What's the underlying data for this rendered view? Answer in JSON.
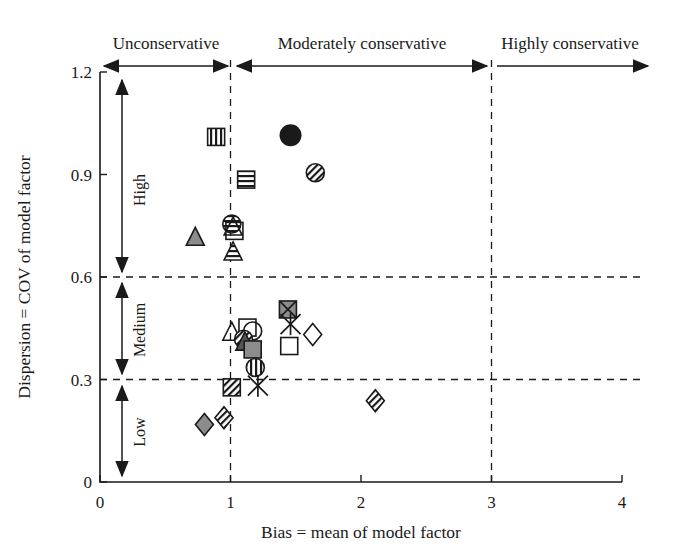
{
  "figure": {
    "top_clipped_caption": "",
    "background": "#ffffff",
    "ink_color": "#1a1a1a",
    "gray_fill": "#8c8c8c"
  },
  "axes": {
    "x_title": "Bias = mean of model factor",
    "y_title": "Dispersion = COV of model factor",
    "x_ticks": [
      "0",
      "1",
      "2",
      "3",
      "4"
    ],
    "y_ticks": [
      "0",
      "0.3",
      "0.6",
      "0.9",
      "1.2"
    ],
    "xlim": [
      0,
      4
    ],
    "ylim": [
      0,
      1.2
    ]
  },
  "zones": {
    "top_labels": [
      "Unconservative",
      "Moderately conservative",
      "Highly conservative"
    ],
    "side_labels": [
      "High",
      "Medium",
      "Low"
    ],
    "vertical_dividers": [
      1,
      3
    ],
    "horizontal_dividers": [
      0.3,
      0.6
    ]
  },
  "chart_data": {
    "type": "scatter",
    "title": "",
    "xlabel": "Bias = mean of model factor",
    "ylabel": "Dispersion = COV of model factor",
    "xlim": [
      0,
      4
    ],
    "ylim": [
      0,
      1.2
    ],
    "xticks": [
      0,
      1,
      2,
      3,
      4
    ],
    "yticks": [
      0,
      0.3,
      0.6,
      0.9,
      1.2
    ],
    "grid": false,
    "legend": "none",
    "reference_lines": {
      "vertical_dashed_x": [
        1,
        3
      ],
      "horizontal_dashed_y": [
        0.3,
        0.6
      ]
    },
    "annotations": [
      {
        "text": "Unconservative",
        "region_x": [
          0,
          1
        ]
      },
      {
        "text": "Moderately conservative",
        "region_x": [
          1,
          3
        ]
      },
      {
        "text": "Highly conservative",
        "region_x": [
          3,
          4
        ]
      },
      {
        "text": "High",
        "region_y": [
          0.6,
          1.2
        ]
      },
      {
        "text": "Medium",
        "region_y": [
          0.3,
          0.6
        ]
      },
      {
        "text": "Low",
        "region_y": [
          0,
          0.3
        ]
      }
    ],
    "points": [
      {
        "x": 0.89,
        "y": 1.01,
        "marker": "square-vertical-stripes"
      },
      {
        "x": 1.12,
        "y": 0.885,
        "marker": "square-horizontal-stripes"
      },
      {
        "x": 1.46,
        "y": 1.015,
        "marker": "circle-filled"
      },
      {
        "x": 1.65,
        "y": 0.905,
        "marker": "circle-diagonal-hatch"
      },
      {
        "x": 1.01,
        "y": 0.755,
        "marker": "circle-horizontal-stripes"
      },
      {
        "x": 1.02,
        "y": 0.745,
        "marker": "triangle-open"
      },
      {
        "x": 1.03,
        "y": 0.735,
        "marker": "square-open"
      },
      {
        "x": 0.73,
        "y": 0.715,
        "marker": "triangle-gray-filled"
      },
      {
        "x": 1.02,
        "y": 0.672,
        "marker": "triangle-horizontal-stripes"
      },
      {
        "x": 1.44,
        "y": 0.505,
        "marker": "square-gray-x"
      },
      {
        "x": 1.46,
        "y": 0.462,
        "marker": "x-cross"
      },
      {
        "x": 1.13,
        "y": 0.452,
        "marker": "square-open"
      },
      {
        "x": 1.17,
        "y": 0.442,
        "marker": "circle-open"
      },
      {
        "x": 1.63,
        "y": 0.432,
        "marker": "diamond-open"
      },
      {
        "x": 1.01,
        "y": 0.437,
        "marker": "triangle-open"
      },
      {
        "x": 1.1,
        "y": 0.418,
        "marker": "circle-diagonal-hatch"
      },
      {
        "x": 1.11,
        "y": 0.408,
        "marker": "triangle-filled-dark"
      },
      {
        "x": 1.45,
        "y": 0.398,
        "marker": "square-open"
      },
      {
        "x": 1.17,
        "y": 0.388,
        "marker": "square-gray-filled"
      },
      {
        "x": 1.19,
        "y": 0.335,
        "marker": "circle-vertical-stripes"
      },
      {
        "x": 1.01,
        "y": 0.277,
        "marker": "square-diagonal-hatch"
      },
      {
        "x": 1.21,
        "y": 0.282,
        "marker": "x-cross"
      },
      {
        "x": 2.11,
        "y": 0.238,
        "marker": "diamond-hatch"
      },
      {
        "x": 0.95,
        "y": 0.188,
        "marker": "diamond-hatch"
      },
      {
        "x": 0.8,
        "y": 0.168,
        "marker": "diamond-gray-filled"
      }
    ]
  }
}
